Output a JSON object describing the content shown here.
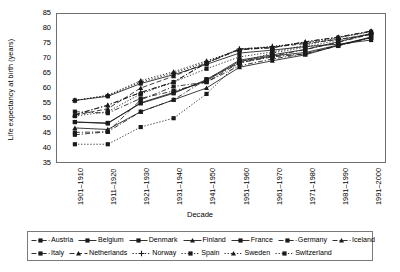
{
  "chart_data": {
    "type": "line",
    "title": "",
    "xlabel": "Decade",
    "ylabel": "Life expectancy at birth (years)",
    "ylim": [
      35,
      85
    ],
    "yticks": [
      35,
      40,
      45,
      50,
      55,
      60,
      65,
      70,
      75,
      80,
      85
    ],
    "grid": false,
    "legend_position": "bottom",
    "categories": [
      "1901–1910",
      "1911–1920",
      "1921–1930",
      "1931–1940",
      "1941–1950",
      "1951–1960",
      "1961–1970",
      "1971–1980",
      "1981–1990",
      "1991–2000"
    ],
    "series": [
      {
        "name": "Austria",
        "marker": "square",
        "dash": "dashdot",
        "values": [
          52.0,
          51.5,
          56.5,
          59.0,
          62.0,
          67.5,
          69.8,
          71.6,
          74.2,
          77.0
        ]
      },
      {
        "name": "Belgium",
        "marker": "square",
        "dash": "solid",
        "values": [
          48.5,
          48.0,
          55.0,
          58.5,
          62.5,
          69.0,
          70.8,
          72.0,
          74.5,
          77.2
        ]
      },
      {
        "name": "Denmark",
        "marker": "square",
        "dash": "solid",
        "values": [
          55.8,
          57.2,
          61.5,
          64.5,
          68.0,
          71.8,
          72.8,
          74.0,
          74.8,
          76.2
        ]
      },
      {
        "name": "Finland",
        "marker": "triangle",
        "dash": "solid",
        "values": [
          46.5,
          46.0,
          52.0,
          56.0,
          60.0,
          67.0,
          69.2,
          71.2,
          74.4,
          77.1
        ]
      },
      {
        "name": "France",
        "marker": "square",
        "dash": "solid",
        "values": [
          48.5,
          48.2,
          54.8,
          58.2,
          62.8,
          69.4,
          71.2,
          73.0,
          75.6,
          78.4
        ]
      },
      {
        "name": "Germany",
        "marker": "square",
        "dash": "dashdot",
        "values": [
          45.0,
          45.2,
          56.0,
          60.5,
          62.0,
          68.5,
          70.5,
          71.5,
          74.4,
          77.0
        ]
      },
      {
        "name": "Iceland",
        "marker": "triangle",
        "dash": "dashdot",
        "values": [
          51.0,
          54.2,
          58.5,
          62.0,
          68.5,
          73.0,
          73.6,
          75.6,
          77.2,
          79.2
        ]
      },
      {
        "name": "Italy",
        "marker": "square",
        "dash": "dashdot",
        "values": [
          44.2,
          45.2,
          52.0,
          56.0,
          63.0,
          68.5,
          70.8,
          73.0,
          75.4,
          78.2
        ]
      },
      {
        "name": "Netherlands",
        "marker": "triangle",
        "dash": "dashed",
        "values": [
          50.8,
          53.0,
          60.0,
          64.0,
          68.5,
          73.2,
          73.8,
          75.0,
          76.4,
          78.0
        ]
      },
      {
        "name": "Norway",
        "marker": "cross",
        "dash": "dotted",
        "values": [
          55.8,
          57.5,
          62.0,
          65.0,
          68.8,
          73.2,
          74.0,
          75.2,
          76.4,
          78.2
        ]
      },
      {
        "name": "Spain",
        "marker": "square",
        "dash": "dotted",
        "values": [
          41.0,
          41.0,
          46.8,
          49.8,
          58.0,
          68.8,
          71.8,
          73.8,
          76.2,
          78.4
        ]
      },
      {
        "name": "Sweden",
        "marker": "triangle",
        "dash": "dotted",
        "values": [
          55.8,
          57.5,
          62.5,
          65.5,
          69.2,
          72.8,
          74.0,
          75.4,
          77.0,
          79.2
        ]
      },
      {
        "name": "Switzerland",
        "marker": "square",
        "dash": "dotted",
        "values": [
          50.5,
          52.0,
          58.0,
          62.0,
          66.5,
          70.5,
          72.2,
          74.4,
          77.0,
          79.0
        ]
      },
      {
        "name": "Iceland2",
        "marker": "triangle",
        "dash": "dashdot",
        "values": [
          51.0,
          54.2,
          58.5,
          62.0,
          68.5,
          73.0,
          73.6,
          75.6,
          77.2,
          79.2
        ]
      }
    ]
  },
  "legend": {
    "rows": [
      [
        {
          "label": "Austria",
          "marker": "square",
          "dash": "dashdot"
        },
        {
          "label": "Belgium",
          "marker": "square",
          "dash": "solid"
        },
        {
          "label": "Denmark",
          "marker": "square",
          "dash": "solid"
        },
        {
          "label": "Finland",
          "marker": "triangle",
          "dash": "solid"
        },
        {
          "label": "France",
          "marker": "square",
          "dash": "solid"
        },
        {
          "label": "Germany",
          "marker": "square",
          "dash": "dashdot"
        },
        {
          "label": "Iceland",
          "marker": "triangle",
          "dash": "dashdot"
        }
      ],
      [
        {
          "label": "Italy",
          "marker": "square",
          "dash": "dashdot"
        },
        {
          "label": "Netherlands",
          "marker": "triangle",
          "dash": "dashed"
        },
        {
          "label": "Norway",
          "marker": "cross",
          "dash": "dotted"
        },
        {
          "label": "Spain",
          "marker": "square",
          "dash": "dotted"
        },
        {
          "label": "Sweden",
          "marker": "triangle",
          "dash": "dotted"
        },
        {
          "label": "Switzerland",
          "marker": "square",
          "dash": "dotted"
        }
      ]
    ]
  },
  "colors": {
    "line": "#1a1a1a",
    "axis": "#6f6f6f",
    "background": "#ffffff"
  }
}
